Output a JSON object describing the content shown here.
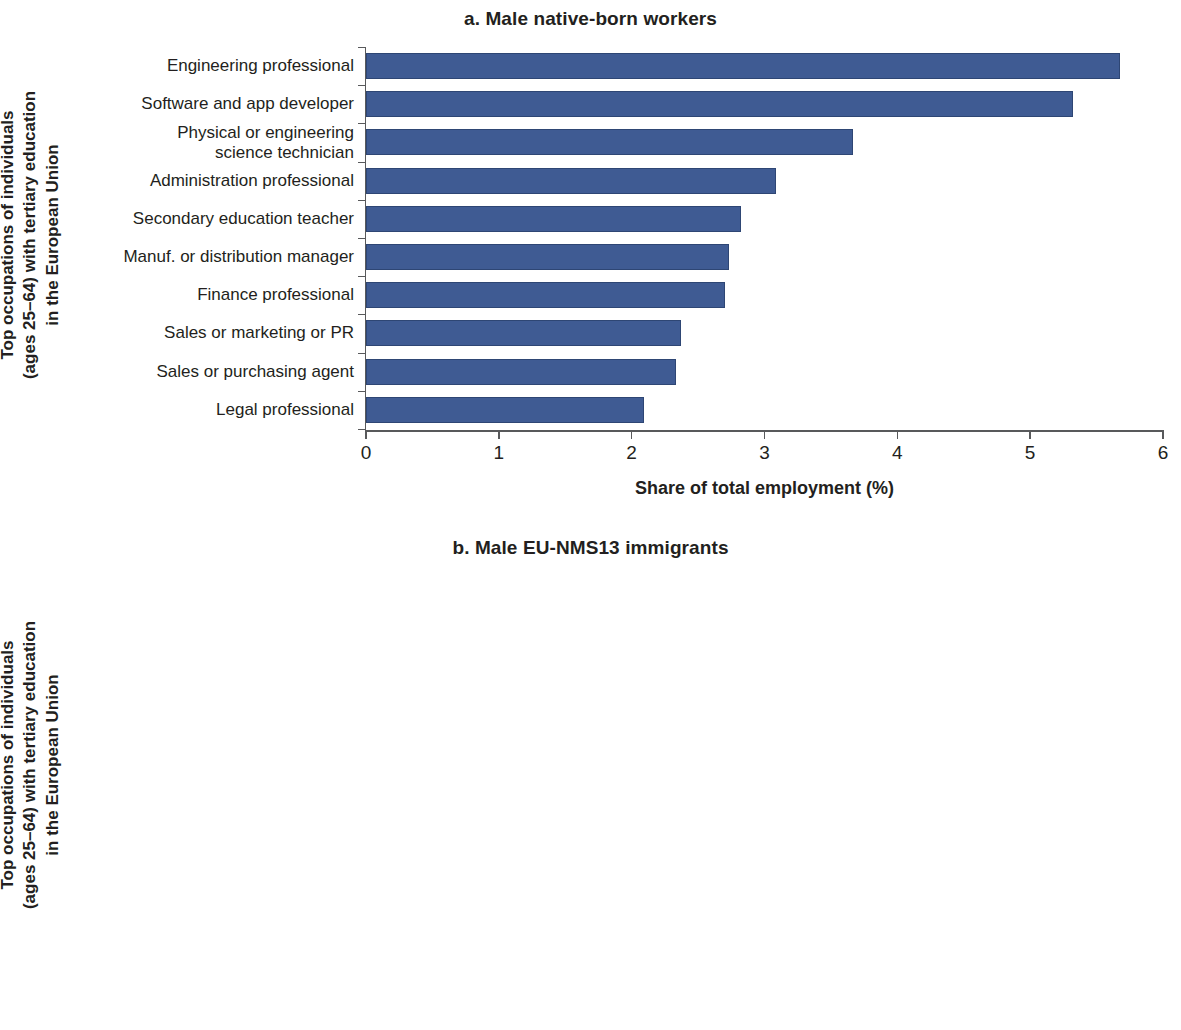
{
  "figure": {
    "y_axis_title_lines": [
      "Top occupations of individuals",
      "(ages 25–64) with tertiary education",
      "in the European Union"
    ],
    "x_axis_title": "Share of total employment (%)",
    "bar_color": "#3f5b93",
    "axis_color": "#58595b",
    "text_color": "#231f20"
  },
  "chart_data": [
    {
      "type": "bar",
      "orientation": "horizontal",
      "title": "a. Male native-born workers",
      "xlabel": "Share of total employment (%)",
      "ylabel": "Top occupations of individuals (ages 25–64) with tertiary education in the European Union",
      "xlim": [
        0,
        6
      ],
      "xticks": [
        0,
        1,
        2,
        3,
        4,
        5,
        6
      ],
      "xtick_labels": [
        "0",
        "1",
        "2",
        "3",
        "4",
        "5",
        "6"
      ],
      "grid": false,
      "legend": null,
      "categories": [
        "Engineering professional",
        "Software and app developer",
        "Physical or engineering\nscience technician",
        "Administration professional",
        "Secondary education teacher",
        "Manuf. or distribution manager",
        "Finance professional",
        "Sales or marketing or PR",
        "Sales or purchasing agent",
        "Legal professional"
      ],
      "values": [
        5.68,
        5.32,
        3.67,
        3.09,
        2.82,
        2.73,
        2.7,
        2.37,
        2.33,
        2.09
      ]
    },
    {
      "type": "bar",
      "orientation": "horizontal",
      "title": "b. Male EU-NMS13 immigrants",
      "xlabel": "Share of total employment (%)",
      "ylabel": "Top occupations of individuals (ages 25–64) with tertiary education in the European Union",
      "xlim": [
        0,
        8
      ],
      "xticks": [
        0,
        1,
        2,
        3,
        4,
        5,
        6,
        7,
        8
      ],
      "xtick_labels": [
        "0",
        "1",
        "2",
        "3",
        "4",
        "5",
        "6",
        "7",
        "8"
      ],
      "grid": false,
      "legend": null,
      "categories": [
        "Software and app developer",
        "Engineering professional",
        "Building frame worker",
        "Physical or engineering\ntechnician",
        "Heavy truck or bus driver",
        "Medical doctor",
        "Building finisher",
        "Transport worker",
        "Machinery mechanic",
        "Manuf manager"
      ],
      "values": [
        7.17,
        4.43,
        3.75,
        3.55,
        3.3,
        2.91,
        2.78,
        2.55,
        2.28,
        2.2
      ]
    }
  ]
}
